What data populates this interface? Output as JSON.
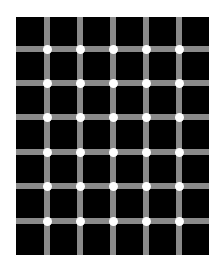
{
  "illusion": {
    "type": "scintillating-grid",
    "colors": {
      "background": "#ffffff",
      "squares": "#000000",
      "lines": "#8a8a8a",
      "dots": "#ffffff"
    },
    "grid_origin": [
      16,
      17
    ],
    "grid_size": [
      193,
      238
    ],
    "vertical_line_x": [
      47,
      80,
      113,
      146,
      179
    ],
    "horizontal_line_y": [
      49,
      83,
      117,
      152,
      186,
      221
    ],
    "line_width": 6,
    "dot_diameter": 9
  }
}
